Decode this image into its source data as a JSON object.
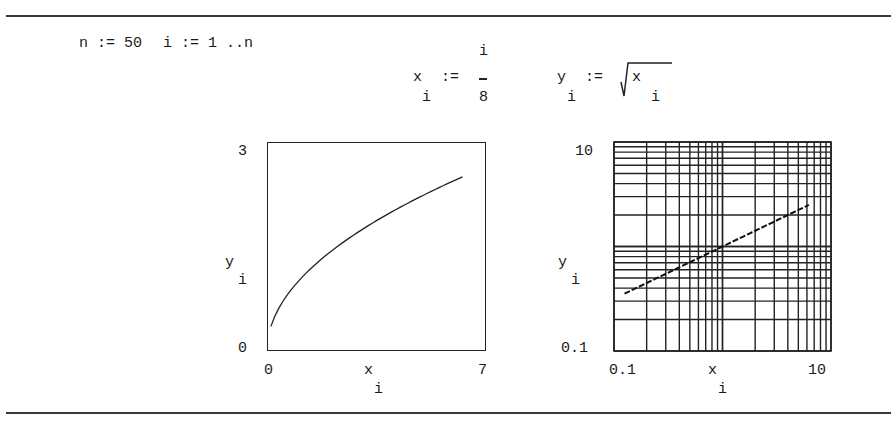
{
  "worksheet": {
    "definitions": {
      "n_def": "n := 50",
      "i_def": "i := 1 ..n",
      "x_def": {
        "lhs": "x",
        "lhs_sub": "i",
        "op": ":=",
        "numerator": "i",
        "denominator": "8"
      },
      "y_def": {
        "lhs": "y",
        "lhs_sub": "i",
        "op": ":=",
        "radicand": "x",
        "radicand_sub": "i"
      }
    },
    "plots": [
      {
        "y_label": "y",
        "y_label_sub": "i",
        "x_label": "x",
        "x_label_sub": "i",
        "y_max_label": "3",
        "y_min_label": "0",
        "x_min_label": "0",
        "x_max_label": "7"
      },
      {
        "y_label": "y",
        "y_label_sub": "i",
        "x_label": "x",
        "x_label_sub": "i",
        "y_max_label": "10",
        "y_min_label": "0.1",
        "x_min_label": "0.1",
        "x_max_label": "10"
      }
    ]
  },
  "chart_data": [
    {
      "type": "line",
      "title": "",
      "xlabel": "x_i",
      "ylabel": "y_i",
      "xlim": [
        0,
        7
      ],
      "ylim": [
        0,
        3
      ],
      "x_scale": "linear",
      "y_scale": "linear",
      "grid": false,
      "series": [
        {
          "name": "y_i = sqrt(x_i)",
          "function": "sqrt(x)",
          "x_range": [
            0.125,
            6.25
          ],
          "points": 50,
          "step": 0.125
        }
      ],
      "tick_labels": {
        "x": [
          "0",
          "7"
        ],
        "y": [
          "0",
          "3"
        ]
      }
    },
    {
      "type": "line",
      "title": "",
      "xlabel": "x_i",
      "ylabel": "y_i",
      "xlim": [
        0.1,
        10
      ],
      "ylim": [
        0.1,
        10
      ],
      "x_scale": "log",
      "y_scale": "log",
      "grid": true,
      "series": [
        {
          "name": "y_i = sqrt(x_i)",
          "function": "sqrt(x)",
          "x_range": [
            0.125,
            6.25
          ],
          "points": 50,
          "step": 0.125
        }
      ],
      "tick_labels": {
        "x": [
          "0.1",
          "10"
        ],
        "y": [
          "0.1",
          "10"
        ]
      }
    }
  ]
}
